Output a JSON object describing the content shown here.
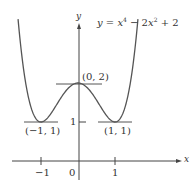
{
  "chart_data": {
    "type": "line",
    "function": "x^4 - 2x^2 + 2",
    "xlabel": "x",
    "ylabel": "y",
    "x_ticks": [
      -1,
      0,
      1
    ],
    "x_tick_labels": [
      "−1",
      "0",
      "1"
    ],
    "y_ticks": [
      1
    ],
    "y_tick_labels": [
      "1"
    ],
    "xlim": [
      -2.1,
      3.1
    ],
    "ylim": [
      -0.6,
      3.5
    ],
    "grid": false,
    "series": [
      {
        "name": "y = x⁴ − 2x² + 2",
        "x": [
          -1.6,
          -1.4,
          -1.2,
          -1.0,
          -0.8,
          -0.6,
          -0.4,
          -0.2,
          0,
          0.2,
          0.4,
          0.6,
          0.8,
          1.0,
          1.2,
          1.4,
          1.6
        ],
        "y": [
          3.43,
          1.92,
          1.19,
          1.0,
          1.13,
          1.41,
          1.71,
          1.92,
          2.0,
          1.92,
          1.71,
          1.41,
          1.13,
          1.0,
          1.19,
          1.92,
          3.43
        ]
      }
    ],
    "annotations": [
      {
        "text": "(0, 2)",
        "x": 0,
        "y": 2,
        "kind": "local maximum",
        "tangent": "horizontal"
      },
      {
        "text": "(−1, 1)",
        "x": -1,
        "y": 1,
        "kind": "local minimum",
        "tangent": "horizontal"
      },
      {
        "text": "(1, 1)",
        "x": 1,
        "y": 1,
        "kind": "local minimum",
        "tangent": "horizontal"
      }
    ]
  },
  "labels": {
    "equation": "y = x⁴ − 2x² + 2",
    "y_axis": "y",
    "x_axis": "x",
    "max_point": "(0, 2)",
    "min_left": "(−1, 1)",
    "min_right": "(1, 1)",
    "tick_x_neg1": "−1",
    "tick_x_0": "0",
    "tick_x_1": "1",
    "tick_y_1": "1"
  },
  "colors": {
    "curve": "#555555",
    "axis": "#444444",
    "text": "#333333"
  }
}
